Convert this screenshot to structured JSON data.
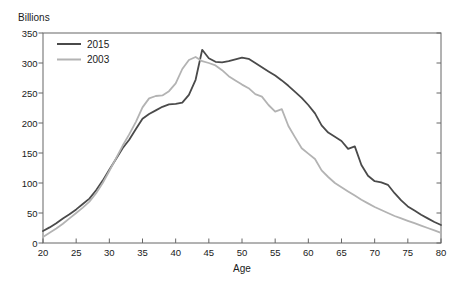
{
  "chart_data": {
    "type": "line",
    "unit_label": "Billions",
    "xlabel": "Age",
    "xlim": [
      20,
      80
    ],
    "ylim": [
      0,
      350
    ],
    "xticks": [
      20,
      25,
      30,
      35,
      40,
      45,
      50,
      55,
      60,
      65,
      70,
      75,
      80
    ],
    "yticks": [
      0,
      50,
      100,
      150,
      200,
      250,
      300,
      350
    ],
    "grid": false,
    "legend_position": "top-left-inside",
    "frame_color": "#666666",
    "text_color": "#1a1a1a",
    "x": [
      20,
      21,
      22,
      23,
      24,
      25,
      26,
      27,
      28,
      29,
      30,
      31,
      32,
      33,
      34,
      35,
      36,
      37,
      38,
      39,
      40,
      41,
      42,
      43,
      44,
      45,
      46,
      47,
      48,
      49,
      50,
      51,
      52,
      53,
      54,
      55,
      56,
      57,
      58,
      59,
      60,
      61,
      62,
      63,
      64,
      65,
      66,
      67,
      68,
      69,
      70,
      71,
      72,
      73,
      74,
      75,
      76,
      77,
      78,
      79,
      80
    ],
    "series": [
      {
        "name": "2015",
        "color": "#4a4a4a",
        "line_width": 1.8,
        "values": [
          20,
          26,
          33,
          41,
          48,
          56,
          65,
          74,
          88,
          104,
          122,
          140,
          158,
          172,
          190,
          207,
          215,
          221,
          227,
          231,
          232,
          234,
          247,
          272,
          322,
          308,
          302,
          301,
          303,
          306,
          309,
          307,
          300,
          293,
          286,
          279,
          271,
          262,
          252,
          242,
          230,
          216,
          196,
          184,
          177,
          170,
          157,
          161,
          130,
          112,
          103,
          101,
          97,
          83,
          71,
          61,
          54,
          47,
          41,
          35,
          30
        ]
      },
      {
        "name": "2003",
        "color": "#b3b3b3",
        "line_width": 1.8,
        "values": [
          10,
          17,
          24,
          32,
          41,
          50,
          59,
          69,
          83,
          100,
          120,
          141,
          162,
          181,
          202,
          226,
          241,
          245,
          246,
          253,
          266,
          290,
          305,
          310,
          303,
          300,
          296,
          288,
          278,
          271,
          264,
          258,
          248,
          244,
          230,
          219,
          223,
          195,
          176,
          158,
          149,
          140,
          121,
          110,
          100,
          93,
          86,
          79,
          72,
          66,
          60,
          55,
          50,
          45,
          41,
          37,
          33,
          29,
          25,
          21,
          17
        ]
      }
    ]
  }
}
